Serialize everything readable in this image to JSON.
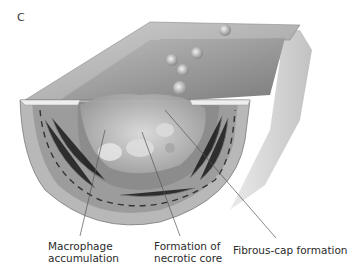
{
  "figure": {
    "panel_letter": "C",
    "labels": {
      "macrophage": [
        "Macrophage",
        "accumulation"
      ],
      "necrotic": [
        "Formation of",
        "necrotic core"
      ],
      "fibrous": "Fibrous-cap formation"
    }
  },
  "colors": {
    "wall_light": "#d8d8d8",
    "wall_mid": "#a9a9a9",
    "wall_dark": "#6f6f6f",
    "leader_line": "#555555"
  }
}
